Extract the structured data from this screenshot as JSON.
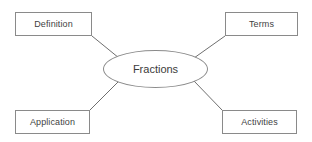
{
  "diagram": {
    "type": "spider-web-concept-map",
    "center": {
      "label": "Fractions",
      "shape": "ellipse",
      "border_color": "#8a8a8a",
      "text_color": "#3b3b3b",
      "fill_color": "#ffffff"
    },
    "nodes": [
      {
        "id": "definition",
        "label": "Definition",
        "shape": "rectangle",
        "position": "top-left"
      },
      {
        "id": "terms",
        "label": "Terms",
        "shape": "rectangle",
        "position": "top-right"
      },
      {
        "id": "application",
        "label": "Application",
        "shape": "rectangle",
        "position": "bottom-left"
      },
      {
        "id": "activities",
        "label": "Activities",
        "shape": "rectangle",
        "position": "bottom-right"
      }
    ],
    "connectors": [
      {
        "id": "definition-to-center",
        "from": "definition",
        "to": "center",
        "x1": 92,
        "y1": 36,
        "x2": 119,
        "y2": 58
      },
      {
        "id": "terms-to-center",
        "from": "terms",
        "to": "center",
        "x1": 225,
        "y1": 36,
        "x2": 194,
        "y2": 58
      },
      {
        "id": "application-to-center",
        "from": "application",
        "to": "center",
        "x1": 90,
        "y1": 110,
        "x2": 119,
        "y2": 81
      },
      {
        "id": "activities-to-center",
        "from": "activities",
        "to": "center",
        "x1": 222,
        "y1": 110,
        "x2": 194,
        "y2": 81
      }
    ],
    "colors": {
      "background": "#ffffff",
      "stroke": "#8a8a8a",
      "connector": "#6f6f6f",
      "text": "#3f3f3f"
    }
  }
}
